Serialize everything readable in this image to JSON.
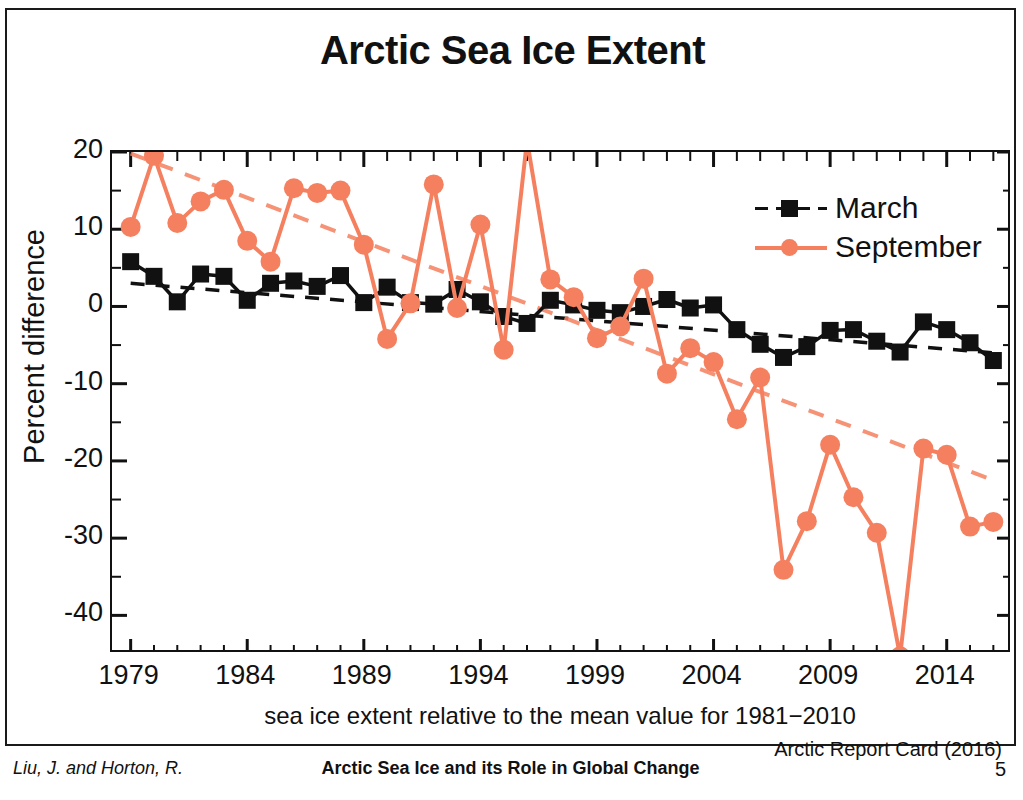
{
  "slide": {
    "title": "Arctic Sea Ice Extent",
    "source_credit": "Arctic Report Card (2016)"
  },
  "footer": {
    "authors": "Liu, J. and Horton, R.",
    "talk_title": "Arctic Sea Ice and its Role in Global Change",
    "page_number": "5"
  },
  "legend": {
    "position": "top-right",
    "entries": [
      {
        "label": "March",
        "color": "#111111",
        "marker": "square",
        "line": "dashed"
      },
      {
        "label": "September",
        "color": "#F5805F",
        "marker": "circle",
        "line": "solid"
      }
    ]
  },
  "axes": {
    "y_label": "Percent difference",
    "y_ticks": [
      "20",
      "10",
      "0",
      "-10",
      "-20",
      "-30",
      "-40"
    ],
    "x_ticks": [
      "1979",
      "1984",
      "1989",
      "1994",
      "1999",
      "2004",
      "2009",
      "2014"
    ],
    "x_caption": "sea ice extent relative to the mean value for 1981−2010"
  },
  "chart_data": {
    "type": "line",
    "title": "Arctic Sea Ice Extent",
    "subtitle": "",
    "xlabel": "sea ice extent relative to the mean value for 1981−2010",
    "ylabel": "Percent difference",
    "xlim": [
      1978.2,
      1978.2
    ],
    "x_range": [
      1978.2,
      2016.3
    ],
    "ylim": [
      -45,
      20
    ],
    "y_ticks": [
      20,
      10,
      0,
      -10,
      -20,
      -30,
      -40
    ],
    "y_minor_tick_step": 5,
    "x_ticks": [
      1979,
      1984,
      1989,
      1994,
      1999,
      2004,
      2009,
      2014
    ],
    "x_minor_tick_step": 1,
    "grid": false,
    "legend_position": "top-right",
    "annotations": [
      "Arctic Report Card (2016)"
    ],
    "x": [
      1979,
      1980,
      1981,
      1982,
      1983,
      1984,
      1985,
      1986,
      1987,
      1988,
      1989,
      1990,
      1991,
      1992,
      1993,
      1994,
      1995,
      1996,
      1997,
      1998,
      1999,
      2000,
      2001,
      2002,
      2003,
      2004,
      2005,
      2006,
      2007,
      2008,
      2009,
      2010,
      2011,
      2012,
      2013,
      2014,
      2015,
      2016
    ],
    "series": [
      {
        "name": "March",
        "color": "#111111",
        "marker": "square",
        "line_style": "solid-with-dashed-trend",
        "values": [
          5.8,
          3.9,
          0.6,
          4.2,
          3.9,
          0.8,
          3.0,
          3.3,
          2.6,
          4.0,
          0.5,
          2.5,
          0.5,
          0.3,
          2.2,
          0.6,
          -1.3,
          -2.2,
          0.8,
          0.2,
          -0.5,
          -0.8,
          0.0,
          0.9,
          -0.2,
          0.2,
          -3.0,
          -4.9,
          -6.6,
          -5.2,
          -3.1,
          -3.0,
          -4.5,
          -5.9,
          -2.0,
          -3.0,
          -4.7,
          -7.0
        ]
      },
      {
        "name": "September",
        "color": "#F5805F",
        "marker": "circle",
        "line_style": "solid-with-dashed-trend",
        "values": [
          10.3,
          19.5,
          10.8,
          13.6,
          15.1,
          8.5,
          5.8,
          15.3,
          14.7,
          15.0,
          8.0,
          -4.2,
          0.4,
          15.8,
          -0.2,
          10.6,
          -5.6,
          21.5,
          3.5,
          1.2,
          -4.1,
          -2.6,
          3.6,
          -8.7,
          -5.4,
          -7.2,
          -14.6,
          -9.2,
          -34.1,
          -27.8,
          -17.9,
          -24.7,
          -29.3,
          -45.3,
          -18.4,
          -19.2,
          -28.5,
          -27.9
        ]
      }
    ],
    "trend_lines": [
      {
        "name": "March trend",
        "color": "#111111",
        "style": "dashed",
        "x": [
          1979,
          2016
        ],
        "y": [
          3.0,
          -6.0
        ]
      },
      {
        "name": "September trend",
        "color": "#F5805F",
        "style": "dashed",
        "x": [
          1979,
          2016
        ],
        "y": [
          19.8,
          -22.5
        ]
      }
    ]
  }
}
